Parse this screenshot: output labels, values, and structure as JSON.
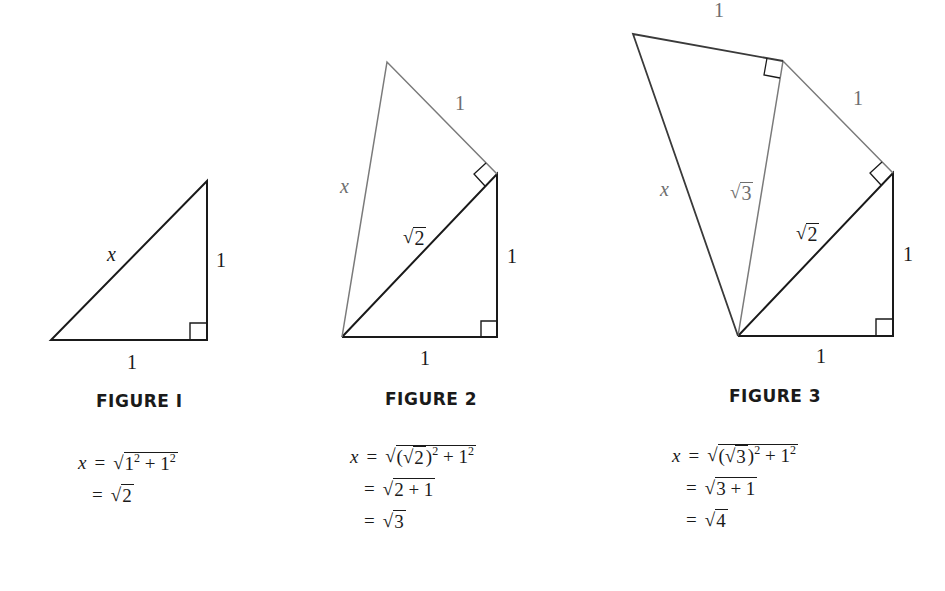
{
  "figures": [
    {
      "id": 1,
      "caption": "FIGURE 1",
      "caption_display": "FIGURE  I",
      "labels": {
        "hyp": "x",
        "vertical": "1",
        "horizontal": "1"
      },
      "equation": {
        "lhs": "x",
        "eq": "=",
        "line1": {
          "radicand_a": "1",
          "sup_a": "2",
          "plus": "+",
          "radicand_b": "1",
          "sup_b": "2"
        },
        "line2": {
          "radicand": "2"
        }
      }
    },
    {
      "id": 2,
      "caption": "FIGURE 2",
      "caption_display": "FIGURE  2",
      "labels": {
        "x": "x",
        "outer_leg": "1",
        "sqrt2": "2",
        "vertical": "1",
        "horizontal": "1"
      },
      "equation": {
        "lhs": "x",
        "eq": "=",
        "line1": {
          "open": "(",
          "inner_radicand": "2",
          "close": ")",
          "sup_a": "2",
          "plus": "+",
          "radicand_b": "1",
          "sup_b": "2"
        },
        "line2": {
          "radicand": "2 + 1"
        },
        "line3": {
          "radicand": "3"
        }
      }
    },
    {
      "id": 3,
      "caption": "FIGURE 3",
      "caption_display": "FIGURE  3",
      "labels": {
        "x": "x",
        "top_leg": "1",
        "second_leg": "1",
        "sqrt3": "3",
        "sqrt2": "2",
        "vertical": "1",
        "horizontal": "1"
      },
      "equation": {
        "lhs": "x",
        "eq": "=",
        "line1": {
          "open": "(",
          "inner_radicand": "3",
          "close": ")",
          "sup_a": "2",
          "plus": "+",
          "radicand_b": "1",
          "sup_b": "2"
        },
        "line2": {
          "radicand": "3 + 1"
        },
        "line3": {
          "radicand": "4"
        }
      }
    }
  ],
  "symbols": {
    "sqrt": "√"
  },
  "colors": {
    "dark_line": "#1a1a1a",
    "gray_line": "#7a7a7a",
    "background": "#ffffff"
  }
}
